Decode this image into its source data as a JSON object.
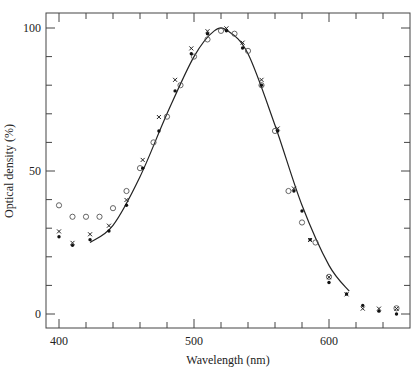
{
  "chart_data": {
    "type": "scatter",
    "title": "",
    "xlabel": "Wavelength (nm)",
    "ylabel": "Optical density (%)",
    "xlim": [
      390,
      660
    ],
    "ylim": [
      -4,
      105
    ],
    "xticks_major": [
      400,
      500,
      600
    ],
    "xticks_minor_step": 20,
    "yticks_major": [
      0,
      50,
      100
    ],
    "yticks_minor_step": 10,
    "grid": false,
    "legend": null,
    "series": [
      {
        "name": "open circles",
        "marker": "circle-open",
        "x": [
          400,
          410,
          420,
          430,
          440,
          450,
          460,
          470,
          480,
          490,
          500,
          510,
          520,
          530,
          540,
          550,
          560,
          570,
          580,
          590,
          600,
          650
        ],
        "y": [
          38,
          34,
          34,
          34,
          37,
          43,
          51,
          60,
          69,
          80,
          90,
          96,
          99,
          98,
          92,
          80,
          64,
          43,
          32,
          25,
          13,
          2
        ]
      },
      {
        "name": "crosses",
        "marker": "x",
        "x": [
          400,
          410,
          423,
          437,
          450,
          462,
          474,
          486,
          498,
          510,
          524,
          536,
          550,
          562,
          574,
          586,
          600,
          613,
          625,
          637,
          650
        ],
        "y": [
          28,
          24,
          27,
          30,
          39,
          53,
          68,
          81,
          92,
          98,
          99,
          94,
          81,
          64,
          43,
          25,
          12,
          6,
          1,
          1,
          1
        ]
      },
      {
        "name": "filled dots",
        "marker": "dot-filled",
        "x": [
          400,
          410,
          423,
          437,
          450,
          462,
          474,
          486,
          498,
          510,
          524,
          536,
          550,
          562,
          574,
          580,
          586,
          600,
          613,
          625,
          637,
          650
        ],
        "y": [
          27,
          24,
          26,
          29,
          38,
          51,
          64,
          78,
          91,
          98,
          99,
          93,
          80,
          64,
          43,
          36,
          26,
          11,
          7,
          3,
          1,
          0
        ]
      },
      {
        "name": "fitted curve",
        "marker": "line",
        "x": [
          423,
          440,
          460,
          480,
          500,
          515,
          525,
          540,
          560,
          580,
          600,
          615
        ],
        "y": [
          25,
          31,
          48,
          70,
          90,
          99,
          99,
          91,
          66,
          38,
          17,
          8
        ]
      }
    ]
  }
}
